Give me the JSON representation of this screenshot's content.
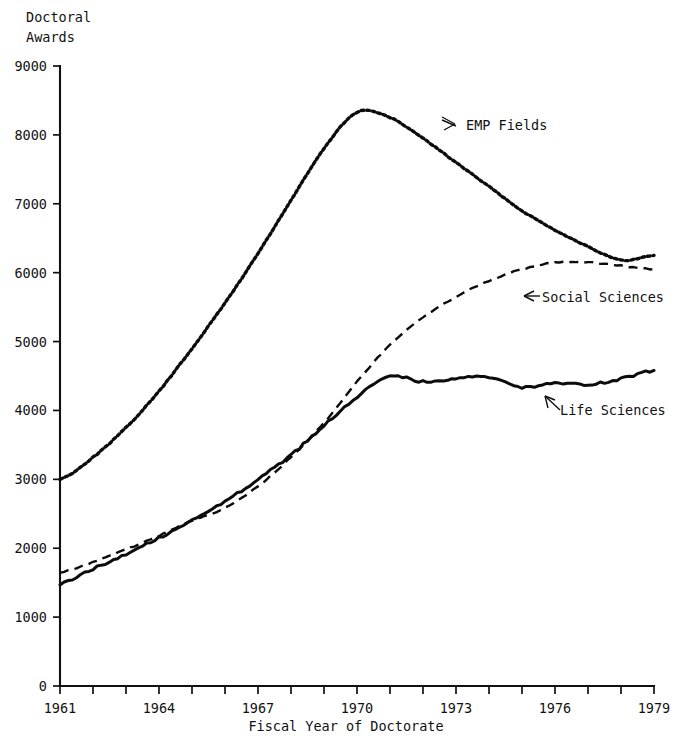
{
  "chart_data": {
    "type": "line",
    "title": "Doctoral Awards",
    "title_line1": "Doctoral",
    "title_line2": "Awards",
    "xlabel": "Fiscal Year of Doctorate",
    "ylabel": "Doctoral Awards",
    "xlim": [
      1961,
      1979
    ],
    "ylim": [
      0,
      9000
    ],
    "grid": false,
    "legend_position": "inline-annotations",
    "x_tick_labels": [
      "1961",
      "1964",
      "1967",
      "1970",
      "1973",
      "1976",
      "1979"
    ],
    "x_tick_values": [
      1961,
      1964,
      1967,
      1970,
      1973,
      1976,
      1979
    ],
    "x_minor_ticks": [
      1961,
      1962,
      1963,
      1964,
      1965,
      1966,
      1967,
      1968,
      1969,
      1970,
      1971,
      1972,
      1973,
      1974,
      1975,
      1976,
      1977,
      1978,
      1979
    ],
    "y_tick_labels": [
      "0",
      "1000",
      "2000",
      "3000",
      "4000",
      "5000",
      "6000",
      "7000",
      "8000",
      "9000"
    ],
    "y_tick_values": [
      0,
      1000,
      2000,
      3000,
      4000,
      5000,
      6000,
      7000,
      8000,
      9000
    ],
    "x": [
      1961,
      1962,
      1963,
      1964,
      1965,
      1966,
      1967,
      1968,
      1969,
      1970,
      1971,
      1972,
      1973,
      1974,
      1975,
      1976,
      1977,
      1978,
      1979
    ],
    "series": [
      {
        "name": "EMP Fields",
        "label": "EMP Fields",
        "style": "dotted",
        "values": [
          3000,
          3320,
          3750,
          4280,
          4900,
          5560,
          6280,
          7050,
          7800,
          8330,
          8250,
          7950,
          7600,
          7250,
          6900,
          6620,
          6380,
          6180,
          6250
        ]
      },
      {
        "name": "Social Sciences",
        "label": "Social Sciences",
        "style": "dashed",
        "values": [
          1650,
          1800,
          1980,
          2180,
          2400,
          2580,
          2900,
          3320,
          3820,
          4420,
          4950,
          5350,
          5650,
          5880,
          6050,
          6150,
          6150,
          6100,
          6050
        ]
      },
      {
        "name": "Life Sciences",
        "label": "Life Sciences",
        "style": "solid",
        "values": [
          1480,
          1700,
          1920,
          2150,
          2400,
          2680,
          3000,
          3350,
          3780,
          4200,
          4500,
          4420,
          4460,
          4480,
          4340,
          4400,
          4380,
          4460,
          4580
        ]
      }
    ],
    "annotations": [
      {
        "text": "EMP Fields",
        "series": "EMP Fields",
        "arrow": "left-down"
      },
      {
        "text": "Social Sciences",
        "series": "Social Sciences",
        "arrow": "left"
      },
      {
        "text": "Life Sciences",
        "series": "Life Sciences",
        "arrow": "up-left"
      }
    ]
  },
  "axes": {
    "y_title_line1": "Doctoral",
    "y_title_line2": "Awards",
    "x_title": "Fiscal Year of Doctorate"
  },
  "labels": {
    "emp": "EMP Fields",
    "social": "Social Sciences",
    "life": "Life Sciences"
  },
  "colors": {
    "ink": "#111111",
    "background": "#ffffff"
  }
}
